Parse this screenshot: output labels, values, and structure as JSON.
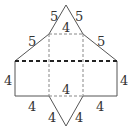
{
  "diagram": {
    "type": "net of triangular prism",
    "labels": {
      "top_left_upper": "5",
      "top_right_upper": "5",
      "top_inner": "4",
      "left_slant": "5",
      "right_slant": "5",
      "left_side": "4",
      "right_side": "4",
      "center_bottom": "4",
      "bottom_left": "4",
      "bottom_right": "4",
      "lower_tri_left": "4",
      "lower_tri_right": "4"
    },
    "colors": {
      "solid_line": "#555555",
      "dashed_line": "#888888",
      "fold_line": "#222222"
    }
  }
}
